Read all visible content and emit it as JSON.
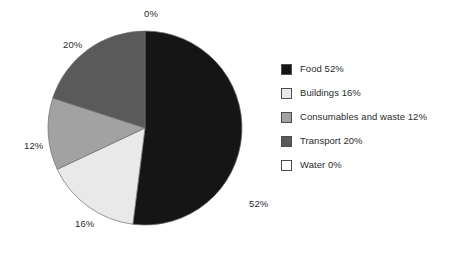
{
  "chart_data": {
    "type": "pie",
    "title": "",
    "labels": [
      "Food",
      "Buildings",
      "Consumables and waste",
      "Transport",
      "Water"
    ],
    "values": [
      52,
      16,
      12,
      20,
      0
    ],
    "value_suffix": "%",
    "colors": [
      "#151515",
      "#e9e9e9",
      "#a2a2a2",
      "#5a5a5a",
      "#ffffff"
    ],
    "start_angle_deg": 0,
    "direction": "clockwise",
    "legend_position": "right",
    "grid": false,
    "slice_labels": [
      {
        "text": "0%",
        "left": 144,
        "top": 9,
        "anchor": "center"
      },
      {
        "text": "20%",
        "left": 63,
        "top": 40,
        "anchor": "center"
      },
      {
        "text": "12%",
        "left": 24,
        "top": 141,
        "anchor": "center"
      },
      {
        "text": "16%",
        "left": 75,
        "top": 219,
        "anchor": "center"
      },
      {
        "text": "52%",
        "left": 249,
        "top": 199,
        "anchor": "center"
      }
    ],
    "geometry": {
      "cx": 145,
      "cy": 128,
      "r": 97
    }
  },
  "legend": {
    "items": [
      {
        "label": "Food 52%",
        "color": "#151515",
        "swatch_name": "legend-swatch-food"
      },
      {
        "label": "Buildings 16%",
        "color": "#e9e9e9",
        "swatch_name": "legend-swatch-buildings"
      },
      {
        "label": "Consumables and waste 12%",
        "color": "#a2a2a2",
        "swatch_name": "legend-swatch-consumables"
      },
      {
        "label": "Transport 20%",
        "color": "#5a5a5a",
        "swatch_name": "legend-swatch-transport"
      },
      {
        "label": "Water 0%",
        "color": "#ffffff",
        "swatch_name": "legend-swatch-water"
      }
    ]
  }
}
